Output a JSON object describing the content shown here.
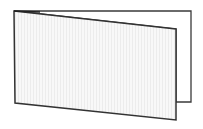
{
  "illustration": {
    "subject": "folded-card",
    "background": "#ffffff",
    "stroke": "#3a3a3a",
    "back_panel_fill": "#ffffff",
    "front_panel_fill": "#f7f7f7",
    "texture_stripe": "#ececec"
  }
}
